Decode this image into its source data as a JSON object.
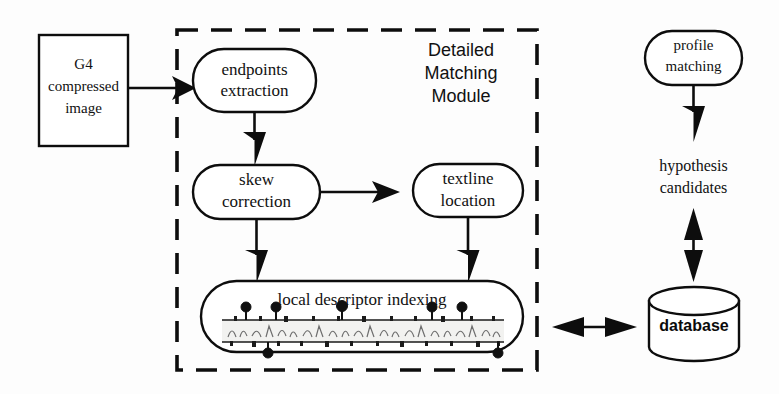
{
  "diagram": {
    "type": "flowchart",
    "background_color": "#fdfdfd",
    "ink_color": "#0d0d0d"
  },
  "input_box": {
    "label_line1": "G4",
    "label_line2": "compressed",
    "label_line3": "image",
    "shape": "rectangle"
  },
  "module": {
    "label_line1": "Detailed",
    "label_line2": "Matching",
    "label_line3": "Module",
    "border_style": "dashed"
  },
  "nodes": [
    {
      "id": "endpoints-extraction",
      "label_line1": "endpoints",
      "label_line2": "extraction",
      "shape": "rounded-rect"
    },
    {
      "id": "skew-correction",
      "label_line1": "skew",
      "label_line2": "correction",
      "shape": "rounded-rect"
    },
    {
      "id": "textline-location",
      "label_line1": "textline",
      "label_line2": "location",
      "shape": "rounded-rect"
    },
    {
      "id": "local-descriptor-indexing",
      "label_line1": "local descriptor indexing",
      "shape": "rounded-rect-with-textline-image"
    }
  ],
  "right_branch": {
    "profile_node": {
      "label_line1": "profile",
      "label_line2": "matching",
      "shape": "rounded-rect"
    },
    "hypothesis_label": {
      "label_line1": "hypothesis",
      "label_line2": "candidates"
    },
    "database": {
      "label": "database",
      "shape": "cylinder"
    }
  },
  "edges": [
    {
      "id": "input-to-endpoints",
      "from": "G4 compressed image",
      "to": "endpoints extraction",
      "direction": "single",
      "orientation": "horizontal"
    },
    {
      "id": "endpoints-to-skew",
      "from": "endpoints extraction",
      "to": "skew correction",
      "direction": "single",
      "orientation": "vertical"
    },
    {
      "id": "skew-to-textline",
      "from": "skew correction",
      "to": "textline location",
      "direction": "single",
      "orientation": "horizontal"
    },
    {
      "id": "skew-to-indexing",
      "from": "skew correction",
      "to": "local descriptor indexing",
      "direction": "single",
      "orientation": "vertical"
    },
    {
      "id": "textline-to-indexing",
      "from": "textline location",
      "to": "local descriptor indexing",
      "direction": "single",
      "orientation": "vertical"
    },
    {
      "id": "profile-to-hypothesis",
      "from": "profile matching",
      "to": "hypothesis candidates",
      "direction": "single",
      "orientation": "vertical"
    },
    {
      "id": "hypothesis-to-database",
      "from": "hypothesis candidates",
      "to": "database",
      "direction": "double",
      "orientation": "vertical"
    },
    {
      "id": "indexing-to-database",
      "from": "local descriptor indexing",
      "to": "database",
      "direction": "double",
      "orientation": "horizontal"
    }
  ],
  "textline_markers": {
    "above": [
      246,
      276,
      342,
      432,
      462
    ],
    "below": [
      268,
      498
    ]
  }
}
